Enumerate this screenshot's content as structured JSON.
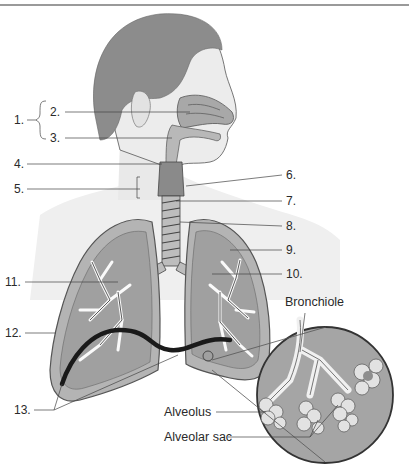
{
  "figure": {
    "numbered_labels": [
      {
        "id": "1",
        "text": "1.",
        "x": 14,
        "y": 118
      },
      {
        "id": "2",
        "text": "2.",
        "x": 50,
        "y": 105
      },
      {
        "id": "3",
        "text": "3.",
        "x": 50,
        "y": 131
      },
      {
        "id": "4",
        "text": "4.",
        "x": 14,
        "y": 158
      },
      {
        "id": "5",
        "text": "5.",
        "x": 14,
        "y": 183
      },
      {
        "id": "6",
        "text": "6.",
        "x": 286,
        "y": 168
      },
      {
        "id": "7",
        "text": "7.",
        "x": 286,
        "y": 196
      },
      {
        "id": "8",
        "text": "8.",
        "x": 286,
        "y": 220
      },
      {
        "id": "9",
        "text": "9.",
        "x": 286,
        "y": 244
      },
      {
        "id": "10",
        "text": "10.",
        "x": 286,
        "y": 268
      },
      {
        "id": "11",
        "text": "11.",
        "x": 5,
        "y": 276
      },
      {
        "id": "12",
        "text": "12.",
        "x": 5,
        "y": 327
      },
      {
        "id": "13",
        "text": "13.",
        "x": 14,
        "y": 404
      }
    ],
    "word_labels": [
      {
        "id": "bronchiole",
        "text": "Bronchiole",
        "x": 285,
        "y": 295
      },
      {
        "id": "alveolus",
        "text": "Alveolus",
        "x": 164,
        "y": 405
      },
      {
        "id": "alveolar_sac",
        "text": "Alveolar sac",
        "x": 164,
        "y": 431
      }
    ],
    "colors": {
      "hair": "#8c8c8c",
      "skin": "#e6e6e6",
      "airway": "#a8a8a8",
      "lung_fill": "#b4b4b4",
      "lung_border": "#9a9a9a",
      "line": "#444444",
      "diaphragm": "#1a1a1a"
    }
  }
}
